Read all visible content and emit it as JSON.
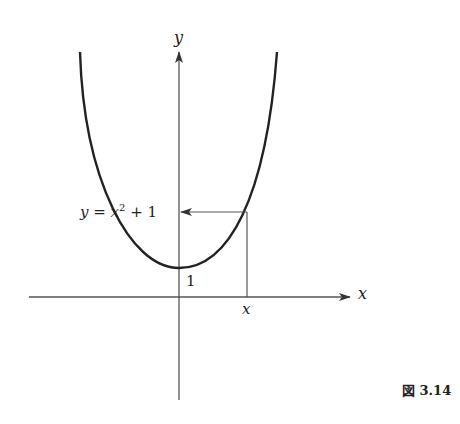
{
  "figure": {
    "caption": "図 3.14",
    "axes": {
      "x_label": "x",
      "y_label": "y"
    },
    "curve": {
      "equation_lhs": "y =",
      "equation_rhs_base": "x",
      "equation_rhs_exp": "2",
      "equation_rhs_tail": "+ 1",
      "equation": "y = x² + 1",
      "stroke_color": "#222222"
    },
    "annotations": {
      "intercept_label": "1",
      "x_marker_label": "x"
    },
    "colors": {
      "axis": "#555555",
      "curve": "#222222",
      "guide": "#555555",
      "background": "#ffffff"
    }
  }
}
